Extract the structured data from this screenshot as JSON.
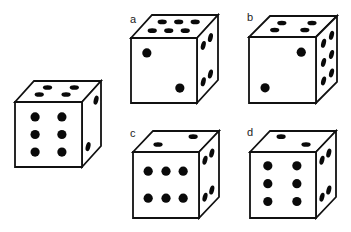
{
  "puzzle": {
    "colors": {
      "line": "#111111",
      "pip": "#0a0a0a",
      "face": "#ffffff",
      "background": "#ffffff"
    },
    "reference_die": {
      "label": "",
      "faces": {
        "top": {
          "count": 4,
          "pips": [
            [
              0.29,
              0.31
            ],
            [
              0.69,
              0.31
            ],
            [
              0.26,
              0.64
            ],
            [
              0.66,
              0.64
            ]
          ]
        },
        "front": {
          "count": 6,
          "pips": [
            [
              0.3,
              0.23
            ],
            [
              0.7,
              0.23
            ],
            [
              0.3,
              0.5
            ],
            [
              0.7,
              0.5
            ],
            [
              0.3,
              0.77
            ],
            [
              0.7,
              0.77
            ]
          ]
        },
        "right": {
          "count": 2,
          "pips": [
            [
              0.74,
              0.21
            ],
            [
              0.32,
              0.79
            ]
          ]
        }
      }
    },
    "options": [
      {
        "label": "a",
        "faces": {
          "top": {
            "count": 6,
            "pips": [
              [
                0.25,
                0.3
              ],
              [
                0.5,
                0.3
              ],
              [
                0.75,
                0.3
              ],
              [
                0.22,
                0.68
              ],
              [
                0.47,
                0.68
              ],
              [
                0.72,
                0.68
              ]
            ]
          },
          "front": {
            "count": 2,
            "pips": [
              [
                0.24,
                0.23
              ],
              [
                0.74,
                0.77
              ]
            ]
          },
          "right": {
            "count": 4,
            "pips": [
              [
                0.3,
                0.22
              ],
              [
                0.64,
                0.22
              ],
              [
                0.3,
                0.78
              ],
              [
                0.64,
                0.78
              ]
            ]
          }
        }
      },
      {
        "label": "b",
        "faces": {
          "top": {
            "count": 4,
            "pips": [
              [
                0.28,
                0.33
              ],
              [
                0.73,
                0.33
              ],
              [
                0.28,
                0.67
              ],
              [
                0.73,
                0.67
              ]
            ]
          },
          "front": {
            "count": 2,
            "pips": [
              [
                0.78,
                0.23
              ],
              [
                0.24,
                0.77
              ]
            ]
          },
          "right": {
            "count": 6,
            "pips": [
              [
                0.36,
                0.21
              ],
              [
                0.74,
                0.21
              ],
              [
                0.36,
                0.5
              ],
              [
                0.74,
                0.5
              ],
              [
                0.36,
                0.78
              ],
              [
                0.74,
                0.78
              ]
            ]
          }
        }
      },
      {
        "label": "c",
        "faces": {
          "top": {
            "count": 2,
            "pips": [
              [
                0.27,
                0.64
              ],
              [
                0.69,
                0.27
              ]
            ]
          },
          "front": {
            "count": 6,
            "pips": [
              [
                0.23,
                0.29
              ],
              [
                0.5,
                0.29
              ],
              [
                0.76,
                0.29
              ],
              [
                0.23,
                0.7
              ],
              [
                0.5,
                0.7
              ],
              [
                0.76,
                0.7
              ]
            ]
          },
          "right": {
            "count": 4,
            "pips": [
              [
                0.3,
                0.22
              ],
              [
                0.64,
                0.22
              ],
              [
                0.3,
                0.78
              ],
              [
                0.64,
                0.78
              ]
            ]
          }
        }
      },
      {
        "label": "d",
        "faces": {
          "top": {
            "count": 2,
            "pips": [
              [
                0.25,
                0.27
              ],
              [
                0.74,
                0.64
              ]
            ]
          },
          "front": {
            "count": 6,
            "pips": [
              [
                0.27,
                0.21
              ],
              [
                0.71,
                0.21
              ],
              [
                0.27,
                0.48
              ],
              [
                0.71,
                0.48
              ],
              [
                0.27,
                0.75
              ],
              [
                0.71,
                0.75
              ]
            ]
          },
          "right": {
            "count": 4,
            "pips": [
              [
                0.3,
                0.22
              ],
              [
                0.64,
                0.22
              ],
              [
                0.3,
                0.78
              ],
              [
                0.64,
                0.78
              ]
            ]
          }
        }
      }
    ]
  }
}
